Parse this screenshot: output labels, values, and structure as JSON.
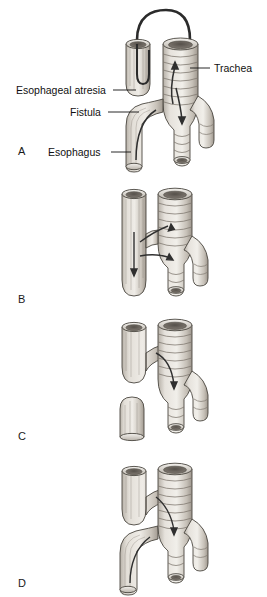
{
  "figure": {
    "background_color": "#ffffff",
    "ink_color": "#1a1a1a",
    "tissue_light": "#e9e6e0",
    "tissue_mid": "#cdc8c0",
    "tissue_dark": "#9b958c",
    "lumen_dark": "#6f6a63",
    "arrow_color": "#3a3a3a"
  },
  "labels": {
    "trachea": "Trachea",
    "esophageal_atresia": "Esophageal atresia",
    "fistula": "Fistula",
    "esophagus": "Esophagus"
  },
  "panels": [
    {
      "letter": "A",
      "name": "esophageal-atresia-with-distal-fistula",
      "structures": [
        "upper esophageal pouch (blind)",
        "trachea with cartilage rings",
        "distal tracheoesophageal fistula",
        "catheter arch over pouch and trachea",
        "right and left main bronchi"
      ]
    },
    {
      "letter": "B",
      "name": "h-type-fistula-without-atresia",
      "structures": [
        "continuous esophagus",
        "trachea with cartilage rings",
        "H-type fistula",
        "right and left main bronchi"
      ]
    },
    {
      "letter": "C",
      "name": "atresia-with-proximal-fistula",
      "structures": [
        "upper esophageal pouch with fistula to trachea",
        "separate blind distal esophageal segment",
        "trachea with cartilage rings",
        "right and left main bronchi"
      ]
    },
    {
      "letter": "D",
      "name": "atresia-with-proximal-and-distal-fistula",
      "structures": [
        "upper esophageal pouch with fistula",
        "distal esophagus with fistula",
        "trachea with cartilage rings",
        "right and left main bronchi"
      ]
    }
  ]
}
